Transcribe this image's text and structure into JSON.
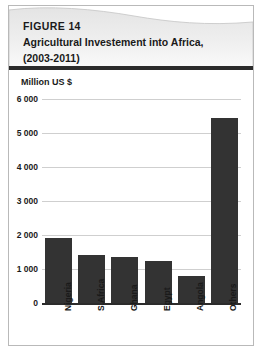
{
  "figure": {
    "number_label": "FIGURE 14",
    "title_line_1": "Agricultural Investement into Africa,",
    "title_line_2": "(2003-2011)",
    "unit_label": "Million US $",
    "border_color": "#b9b9b9",
    "header_gradient_start": "#e8e8e8",
    "header_gradient_end": "#ffffff",
    "rule_color": "#2b2b2b"
  },
  "chart_data": {
    "type": "bar",
    "title": "Agricultural Investement into Africa, (2003-2011)",
    "xlabel": "",
    "ylabel": "Million US $",
    "ylim": [
      0,
      6000
    ],
    "ytick_labels": [
      "6 000",
      "5 000",
      "4 000",
      "3 000",
      "2 000",
      "1 000",
      "0"
    ],
    "ytick_values": [
      6000,
      5000,
      4000,
      3000,
      2000,
      1000,
      0
    ],
    "grid": true,
    "legend": false,
    "bar_color": "#333333",
    "gridline_color": "#cfcfcf",
    "categories": [
      "Nigeria",
      "S.Africa",
      "Ghana",
      "Egypt",
      "Angola",
      "Others"
    ],
    "values": [
      1900,
      1400,
      1350,
      1250,
      800,
      5450
    ]
  }
}
